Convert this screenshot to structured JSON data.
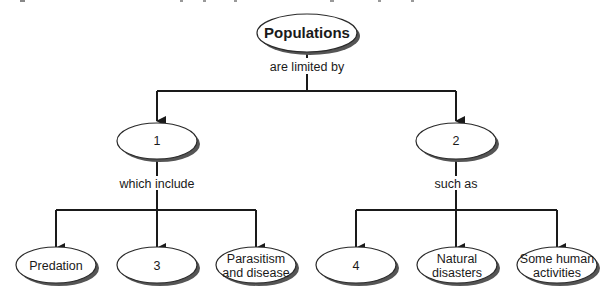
{
  "header": {
    "cropped_caption": "Figure partially cropped at top edge"
  },
  "diagram": {
    "type": "concept-map",
    "colors": {
      "line": "#1a1a1a",
      "node_fill": "#ffffff",
      "node_stroke": "#2a2a2a",
      "shadow": "#555555"
    },
    "root": {
      "id": "populations",
      "label": "Populations"
    },
    "root_link": "are limited by",
    "branches": [
      {
        "id": "node-1",
        "label": "1",
        "link": "which include",
        "children": [
          {
            "id": "predation",
            "lines": [
              "Predation"
            ]
          },
          {
            "id": "node-3",
            "lines": [
              "3"
            ]
          },
          {
            "id": "parasitism",
            "lines": [
              "Parasitism",
              "and disease"
            ]
          }
        ]
      },
      {
        "id": "node-2",
        "label": "2",
        "link": "such as",
        "children": [
          {
            "id": "node-4",
            "lines": [
              "4"
            ]
          },
          {
            "id": "natural-disasters",
            "lines": [
              "Natural",
              "disasters"
            ]
          },
          {
            "id": "human-activities",
            "lines": [
              "Some human",
              "activities"
            ]
          }
        ]
      }
    ]
  }
}
